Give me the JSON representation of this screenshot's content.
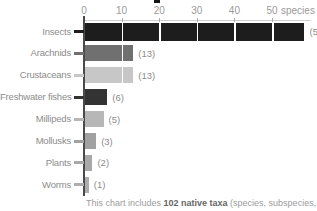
{
  "chart_data": {
    "type": "bar",
    "orientation": "horizontal",
    "title": "",
    "xlabel": "species",
    "ylabel": "",
    "xlim": [
      0,
      59
    ],
    "grid": "white vertical gridlines over bars at each 10-unit tick",
    "axis": {
      "ticks": [
        0,
        10,
        20,
        30,
        40,
        50
      ],
      "tick_labels": [
        "0",
        "10",
        "20",
        "30",
        "40",
        "50"
      ],
      "unit_label": "species"
    },
    "categories": [
      "Insects",
      "Arachnids",
      "Crustaceans",
      "Freshwater fishes",
      "Millipeds",
      "Mollusks",
      "Plants",
      "Worms"
    ],
    "values": [
      59,
      13,
      13,
      6,
      5,
      3,
      2,
      1
    ],
    "value_labels": [
      "(59)",
      "(13)",
      "(13)",
      "(6)",
      "(5)",
      "(3)",
      "(2)",
      "(1)"
    ],
    "bar_colors": [
      "#1d1d1d",
      "#707070",
      "#c7c7c7",
      "#333333",
      "#b7b7b7",
      "#a1a1a1",
      "#a9a9a9",
      "#adadad"
    ]
  },
  "colors": {
    "axis_line": "#4a4a4a",
    "axis_baseline": "#cfcfcf",
    "tick_text": "#9a9a9a",
    "label_text": "#8c8c8c",
    "caption_text": "#9c9c9c",
    "caption_bold_text": "#666666",
    "background": "#ffffff"
  },
  "caption": {
    "prefix": "This chart includes ",
    "bold": "102 native taxa",
    "suffix": " (species, subspecies,"
  }
}
